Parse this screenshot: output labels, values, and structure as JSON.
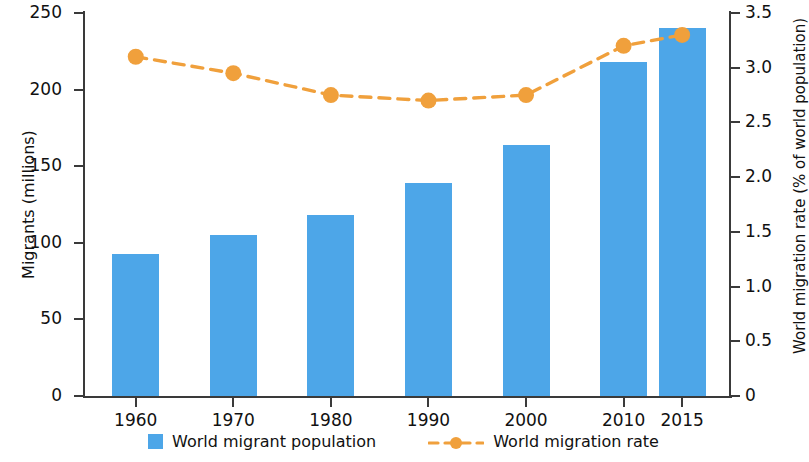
{
  "chart_data": {
    "type": "bar",
    "title": "",
    "xlabel": "",
    "categories": [
      "1960",
      "1970",
      "1980",
      "1990",
      "2000",
      "2010",
      "2015"
    ],
    "series": [
      {
        "name": "World migrant population",
        "type": "bar",
        "axis": "left",
        "unit": "millions",
        "color": "#4da6e8",
        "values": [
          93,
          105,
          118,
          139,
          164,
          218,
          240
        ]
      },
      {
        "name": "World migration rate",
        "type": "line",
        "axis": "right",
        "unit": "% of world population",
        "color": "#f0a03c",
        "linestyle": "dashed",
        "marker": "circle",
        "values": [
          3.1,
          2.95,
          2.75,
          2.7,
          2.75,
          3.2,
          3.3
        ]
      }
    ],
    "left_axis": {
      "label": "Migrants (millions)",
      "ylim": [
        0,
        250
      ],
      "ticks": [
        "0",
        "50",
        "100",
        "150",
        "200",
        "250"
      ],
      "tick_values": [
        0,
        50,
        100,
        150,
        200,
        250
      ]
    },
    "right_axis": {
      "label": "World migration rate (% of world population)",
      "ylim": [
        0,
        3.5
      ],
      "ticks": [
        "0",
        "0.5",
        "1.0",
        "1.5",
        "2.0",
        "2.5",
        "3.0",
        "3.5"
      ],
      "tick_values": [
        0,
        0.5,
        1.0,
        1.5,
        2.0,
        2.5,
        3.0,
        3.5
      ]
    },
    "grid": false,
    "legend": {
      "position": "bottom",
      "entries": [
        {
          "label": "World migrant population",
          "color": "#4da6e8",
          "marker": "square"
        },
        {
          "label": "World migration rate",
          "color": "#f0a03c",
          "marker": "dashed-line-circle"
        }
      ]
    }
  }
}
